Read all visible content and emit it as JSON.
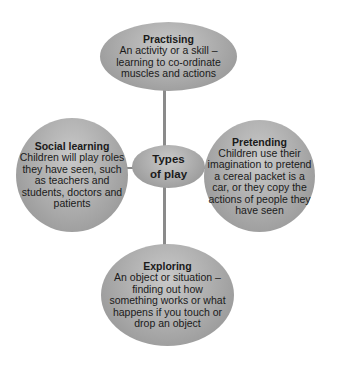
{
  "diagram": {
    "center": {
      "title_line1": "Types",
      "title_line2": "of play"
    },
    "nodes": {
      "top": {
        "title": "Practising",
        "lines": [
          "An activity or a skill –",
          "learning to co-ordinate",
          "muscles and actions"
        ]
      },
      "left": {
        "title": "Social learning",
        "lines": [
          "Children will play roles",
          "they have seen, such",
          "as teachers and",
          "students, doctors and",
          "patients"
        ]
      },
      "right": {
        "title": "Pretending",
        "lines": [
          "Children use their",
          "imagination to pretend",
          "a cereal packet is a",
          "car, or they copy the",
          "actions of people they",
          "have seen"
        ]
      },
      "bottom": {
        "title": "Exploring",
        "lines": [
          "An object or situation –",
          "finding out how",
          "something works or what",
          "happens if you touch or",
          "drop an object"
        ]
      }
    },
    "colors": {
      "node_fill": "#a9a9a9",
      "connector": "#8a8a8a",
      "text": "#1a1a1a"
    }
  }
}
